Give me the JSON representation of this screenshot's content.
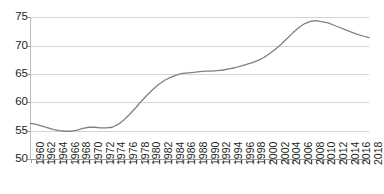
{
  "chart_data": {
    "type": "line",
    "title": "",
    "title_clipped_note": "",
    "xlabel": "",
    "ylabel": "",
    "ylim": [
      50,
      75
    ],
    "yticks": [
      50,
      55,
      60,
      65,
      70,
      75
    ],
    "ytick_labels": [
      "50",
      "55",
      "60",
      "65",
      "70",
      "75"
    ],
    "grid": "horizontal",
    "legend": "none",
    "line_color": "#808080",
    "x": [
      1960,
      1961,
      1962,
      1963,
      1964,
      1965,
      1966,
      1967,
      1968,
      1969,
      1970,
      1971,
      1972,
      1973,
      1974,
      1975,
      1976,
      1977,
      1978,
      1979,
      1980,
      1981,
      1982,
      1983,
      1984,
      1985,
      1986,
      1987,
      1988,
      1989,
      1990,
      1991,
      1992,
      1993,
      1994,
      1995,
      1996,
      1997,
      1998,
      1999,
      2000,
      2001,
      2002,
      2003,
      2004,
      2005,
      2006,
      2007,
      2008,
      2009,
      2010,
      2011,
      2012,
      2013,
      2014,
      2015,
      2016,
      2017,
      2018
    ],
    "xtick_labels": [
      "1960",
      "1962",
      "1964",
      "1966",
      "1968",
      "1970",
      "1972",
      "1974",
      "1976",
      "1978",
      "1980",
      "1982",
      "1984",
      "1986",
      "1988",
      "1990",
      "1992",
      "1994",
      "1996",
      "1998",
      "2000",
      "2002",
      "2004",
      "2006",
      "2008",
      "2010",
      "2012",
      "2014",
      "2016",
      "2018"
    ],
    "values": [
      56.3,
      56.1,
      55.8,
      55.5,
      55.2,
      55.0,
      54.9,
      54.9,
      55.1,
      55.4,
      55.6,
      55.6,
      55.5,
      55.5,
      55.6,
      56.1,
      56.9,
      57.9,
      59.0,
      60.2,
      61.3,
      62.3,
      63.2,
      63.9,
      64.4,
      64.8,
      65.1,
      65.2,
      65.3,
      65.4,
      65.5,
      65.5,
      65.6,
      65.7,
      65.9,
      66.1,
      66.4,
      66.7,
      67.0,
      67.4,
      67.9,
      68.6,
      69.4,
      70.3,
      71.3,
      72.3,
      73.2,
      73.9,
      74.3,
      74.4,
      74.2,
      74.0,
      73.6,
      73.2,
      72.8,
      72.4,
      72.0,
      71.7,
      71.4
    ]
  },
  "axes": {
    "y_axis_name": "y-axis",
    "x_axis_name": "x-axis"
  }
}
